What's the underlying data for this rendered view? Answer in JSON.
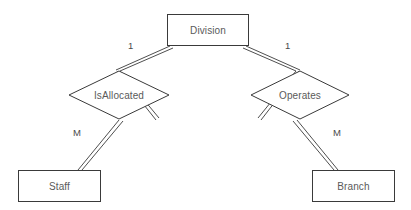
{
  "diagram": {
    "type": "entity-relationship-diagram",
    "notation": "chen",
    "background_color": "#ffffff",
    "stroke_color": "#3a3a3a",
    "text_color": "#5a5a5a",
    "entities": [
      {
        "id": "division",
        "label": "Division",
        "x": 167,
        "y": 14,
        "w": 82,
        "h": 32
      },
      {
        "id": "staff",
        "label": "Staff",
        "x": 18,
        "y": 170,
        "w": 83,
        "h": 32
      },
      {
        "id": "branch",
        "label": "Branch",
        "x": 312,
        "y": 170,
        "w": 83,
        "h": 32
      }
    ],
    "relationships": [
      {
        "id": "isallocated",
        "label": "IsAllocated",
        "cx": 119,
        "cy": 95,
        "rx": 51,
        "ry": 25
      },
      {
        "id": "operates",
        "label": "Operates",
        "cx": 300,
        "cy": 95,
        "rx": 50,
        "ry": 25
      }
    ],
    "connectors": [
      {
        "id": "division-isallocated",
        "from": "division",
        "to": "isallocated",
        "cardinality": "1"
      },
      {
        "id": "isallocated-staff",
        "from": "isallocated",
        "to": "staff",
        "cardinality": "M"
      },
      {
        "id": "division-operates",
        "from": "division",
        "to": "operates",
        "cardinality": "1"
      },
      {
        "id": "operates-branch",
        "from": "operates",
        "to": "branch",
        "cardinality": "M"
      }
    ],
    "cardinality_labels": [
      {
        "id": "card-division-isallocated",
        "text": "1",
        "x": 128,
        "y": 41
      },
      {
        "id": "card-division-operates",
        "text": "1",
        "x": 285,
        "y": 41
      },
      {
        "id": "card-isallocated-staff",
        "text": "M",
        "x": 73,
        "y": 128
      },
      {
        "id": "card-operates-branch",
        "text": "M",
        "x": 333,
        "y": 128
      }
    ]
  }
}
